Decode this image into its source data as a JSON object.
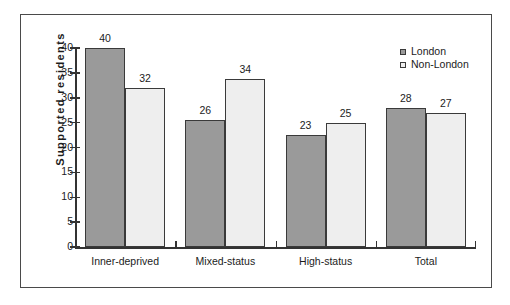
{
  "chart_data": {
    "type": "bar",
    "title": "",
    "xlabel": "",
    "ylabel": "Supported  residents",
    "ylim": [
      0,
      40
    ],
    "yticks": [
      0,
      5,
      10,
      15,
      20,
      25,
      30,
      35,
      40
    ],
    "grid": false,
    "legend_position": "top-right",
    "categories": [
      "Inner-deprived",
      "Mixed-status",
      "High-status",
      "Total"
    ],
    "series": [
      {
        "name": "London",
        "color": "#9a9a9a",
        "values": [
          40,
          25.5,
          22.5,
          28
        ],
        "labels": [
          "40",
          "26",
          "23",
          "28"
        ]
      },
      {
        "name": "Non-London",
        "color": "#eeeeee",
        "values": [
          32,
          33.8,
          25,
          26.9
        ],
        "labels": [
          "32",
          "34",
          "25",
          "27"
        ]
      }
    ]
  },
  "legend": {
    "items": [
      {
        "label": "London",
        "swatch": "london"
      },
      {
        "label": "Non-London",
        "swatch": "nonlondon"
      }
    ]
  }
}
